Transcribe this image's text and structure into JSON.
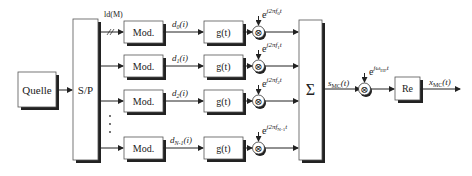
{
  "diagram": {
    "blocks": {
      "source": "Quelle",
      "sp": "S/P",
      "sum": "Σ",
      "re": "Re"
    },
    "bus_label": "ld(M)",
    "branches": [
      {
        "mod": "Mod.",
        "data": "d",
        "data_sub": "0",
        "data_arg": "(i)",
        "filter": "g(t)",
        "carrier": "e",
        "carrier_exp": "j2πf",
        "carrier_sub": "0",
        "carrier_t": "t"
      },
      {
        "mod": "Mod.",
        "data": "d",
        "data_sub": "1",
        "data_arg": "(i)",
        "filter": "g(t)",
        "carrier": "e",
        "carrier_exp": "j2πf",
        "carrier_sub": "1",
        "carrier_t": "t"
      },
      {
        "mod": "Mod.",
        "data": "d",
        "data_sub": "2",
        "data_arg": "(i)",
        "filter": "g(t)",
        "carrier": "e",
        "carrier_exp": "j2πf",
        "carrier_sub": "2",
        "carrier_t": "t"
      },
      {
        "mod": "Mod.",
        "data": "d",
        "data_sub": "N-1",
        "data_arg": "(i)",
        "filter": "g(t)",
        "carrier": "e",
        "carrier_exp": "j2πf",
        "carrier_sub": "N-1",
        "carrier_t": "t"
      }
    ],
    "ellipsis": "⋮",
    "smc": {
      "main": "s",
      "sub": "MC",
      "arg": "(t)"
    },
    "hf_carrier": {
      "base": "e",
      "exp": "jω",
      "sub": "HF",
      "t": "t"
    },
    "xmc": {
      "main": "x",
      "sub": "MC",
      "arg": "(t)"
    },
    "multiplier_symbol": "⊗"
  }
}
